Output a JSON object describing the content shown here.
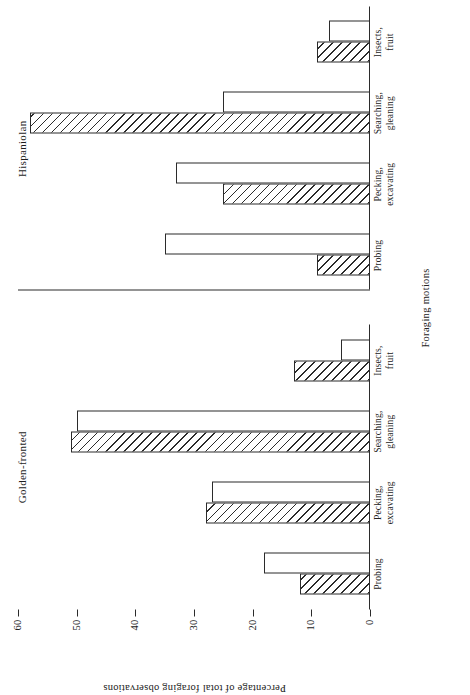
{
  "chart_data": {
    "type": "bar",
    "title": "",
    "xlabel": "Foraging motions",
    "ylabel": "Percentage of total foraging observations",
    "ylim": [
      0,
      60
    ],
    "yticks": [
      0,
      10,
      20,
      30,
      40,
      50,
      60
    ],
    "grid": false,
    "legend_position": "none",
    "orientation": "horizontal-bars-rotated",
    "categories": [
      "Probing",
      "Pecking, excavating",
      "Searching, gleaning",
      "Insects, fruit"
    ],
    "category_labels": [
      [
        "Probing",
        ""
      ],
      [
        "Pecking,",
        "excavating"
      ],
      [
        "Searching,",
        "gleaning"
      ],
      [
        "Insects,",
        "fruit"
      ]
    ],
    "panels": [
      {
        "name": "Golden-fronted",
        "series": [
          {
            "name": "hatched",
            "fill": "hatched",
            "values": [
              12,
              28,
              51,
              13
            ]
          },
          {
            "name": "open",
            "fill": "open",
            "values": [
              18,
              27,
              50,
              5
            ]
          }
        ]
      },
      {
        "name": "Hispaniolan",
        "series": [
          {
            "name": "hatched",
            "fill": "hatched",
            "values": [
              9,
              25,
              58,
              9
            ]
          },
          {
            "name": "open",
            "fill": "open",
            "values": [
              35,
              33,
              25,
              7
            ]
          }
        ]
      }
    ],
    "colors": {
      "line": "#2b2b2b",
      "background": "#ffffff",
      "hatch": "#2b2b2b"
    }
  }
}
